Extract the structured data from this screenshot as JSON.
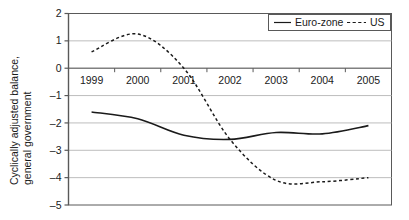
{
  "chart_data": {
    "type": "line",
    "title": "",
    "xlabel": "",
    "ylabel": "Cyclically adjusted balance,",
    "ylabel_line2": "general government",
    "categories": [
      "1999",
      "2000",
      "2001",
      "2002",
      "2003",
      "2004",
      "2005"
    ],
    "ylim": [
      -5,
      2
    ],
    "yticks": [
      "2",
      "1",
      "0",
      "-1",
      "-2",
      "-3",
      "-4",
      "-5"
    ],
    "ytick_values": [
      2,
      1,
      0,
      -1,
      -2,
      -3,
      -4,
      -5
    ],
    "grid": true,
    "grid_axis": "y",
    "legend_position": "top-right",
    "series": [
      {
        "name": "Euro-zone",
        "style": "solid",
        "color": "#1a1a1a",
        "values": [
          -1.6,
          -1.85,
          -2.45,
          -2.6,
          -2.35,
          -2.4,
          -2.1
        ]
      },
      {
        "name": "US",
        "style": "dashed",
        "color": "#1a1a1a",
        "values": [
          0.6,
          1.25,
          0.0,
          -2.6,
          -4.1,
          -4.15,
          -4.0
        ]
      }
    ]
  },
  "legend": {
    "items": [
      {
        "label": "Euro-zone",
        "style": "solid"
      },
      {
        "label": "US",
        "style": "dashed"
      }
    ]
  }
}
